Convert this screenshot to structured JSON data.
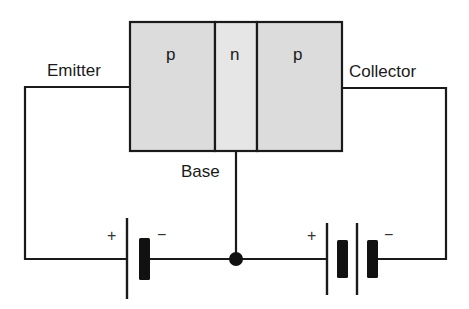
{
  "diagram": {
    "type": "pnp-transistor-bias-circuit",
    "regions": [
      {
        "label": "p",
        "role": "emitter-region",
        "fill": "#dcdcdc"
      },
      {
        "label": "n",
        "role": "base-region",
        "fill": "#e6e6e6"
      },
      {
        "label": "p",
        "role": "collector-region",
        "fill": "#dcdcdc"
      }
    ],
    "terminals": {
      "emitter": "Emitter",
      "base": "Base",
      "collector": "Collector"
    },
    "batteries": [
      {
        "name": "emitter-base-battery",
        "cells": 1,
        "plus": "+",
        "minus": "−"
      },
      {
        "name": "collector-base-battery",
        "cells": 2,
        "plus": "+",
        "minus": "−"
      }
    ],
    "colors": {
      "line": "#1a1a1a",
      "region_fill": "#dcdcdc",
      "background": "#ffffff"
    }
  }
}
